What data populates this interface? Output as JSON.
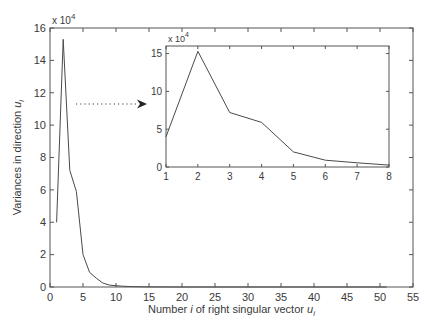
{
  "chart_data": [
    {
      "id": "main",
      "type": "line",
      "title": "",
      "xlabel": "Number i of right singular vector u_i",
      "xlabel_parts": {
        "pre": "Number ",
        "italic1": "i",
        "mid": " of right singular vector ",
        "italic2": "u",
        "sub": "i"
      },
      "ylabel": "Variances in direction u_i",
      "ylabel_parts": {
        "pre": "Variances in direction ",
        "italic": "u",
        "sub": "i"
      },
      "y_multiplier": "x 10^4",
      "xlim": [
        0,
        55
      ],
      "ylim": [
        0,
        16
      ],
      "xticks": [
        0,
        5,
        10,
        15,
        20,
        25,
        30,
        35,
        40,
        45,
        50,
        55
      ],
      "yticks": [
        0,
        2,
        4,
        6,
        8,
        10,
        12,
        14,
        16
      ],
      "grid": false,
      "x": [
        1,
        2,
        3,
        4,
        5,
        6,
        7,
        8,
        9,
        10,
        11,
        12,
        13,
        14,
        15,
        20,
        25,
        30,
        35,
        40,
        45,
        50,
        51
      ],
      "values": [
        4.0,
        15.3,
        7.2,
        5.9,
        2.0,
        0.9,
        0.55,
        0.25,
        0.12,
        0.08,
        0.05,
        0.03,
        0.02,
        0.01,
        0.005,
        0.002,
        0.001,
        0.0,
        0.0,
        0.0,
        0.0,
        0.0,
        0.0
      ]
    },
    {
      "id": "inset",
      "type": "line",
      "title": "",
      "y_multiplier": "x 10^4",
      "xlim": [
        1,
        8
      ],
      "ylim": [
        0,
        16
      ],
      "xticks": [
        1,
        2,
        3,
        4,
        5,
        6,
        7,
        8
      ],
      "yticks": [
        0,
        5,
        10,
        15
      ],
      "grid": false,
      "x": [
        1,
        2,
        3,
        4,
        5,
        6,
        7,
        8
      ],
      "values": [
        4.0,
        15.3,
        7.2,
        5.9,
        2.0,
        0.9,
        0.55,
        0.25
      ]
    }
  ],
  "annotation": {
    "type": "dotted-arrow",
    "description": "points from main peak to inset"
  },
  "colors": {
    "line": "#4a4a4a",
    "axis": "#555555",
    "text": "#3a3a3a"
  }
}
